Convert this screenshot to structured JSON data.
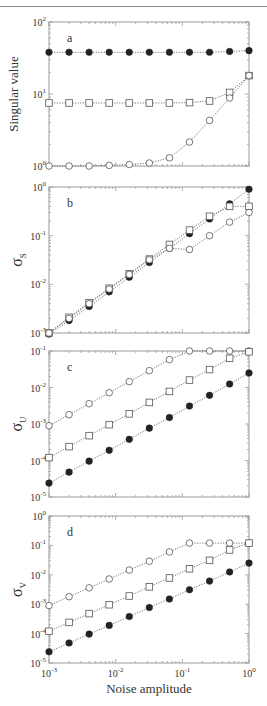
{
  "figure": {
    "x_label": "Noise amplitude",
    "x_scale": "log",
    "x_range": [
      0.001,
      1
    ],
    "x_ticks": [
      {
        "base": "10",
        "exp": "-3",
        "v": 0.001
      },
      {
        "base": "10",
        "exp": "-2",
        "v": 0.01
      },
      {
        "base": "10",
        "exp": "-1",
        "v": 0.1
      },
      {
        "base": "10",
        "exp": "0",
        "v": 1
      }
    ],
    "colors": {
      "frame": "#9a9a9a",
      "line": "#555555",
      "marker": "#222222",
      "text": "#333333"
    }
  },
  "chart_data": [
    {
      "type": "line",
      "panel": "a",
      "title": "",
      "xlabel": "",
      "ylabel": "Singular value",
      "ylabel_sub": "",
      "xscale": "log",
      "yscale": "log",
      "xlim": [
        0.001,
        1
      ],
      "ylim": [
        1,
        100
      ],
      "y_ticks": [
        {
          "base": "10",
          "exp": "0",
          "v": 1
        },
        {
          "base": "10",
          "exp": "1",
          "v": 10
        },
        {
          "base": "10",
          "exp": "2",
          "v": 100
        }
      ],
      "x": [
        0.001,
        0.002,
        0.004,
        0.008,
        0.016,
        0.032,
        0.064,
        0.128,
        0.256,
        0.512,
        1.0
      ],
      "series": [
        {
          "name": "filled circles",
          "marker": "filled-circle",
          "values": [
            38,
            38,
            38,
            38,
            38,
            38,
            38,
            38,
            38,
            39,
            40
          ]
        },
        {
          "name": "open squares",
          "marker": "open-square",
          "values": [
            7.5,
            7.5,
            7.5,
            7.5,
            7.5,
            7.5,
            7.5,
            7.6,
            8.0,
            10.5,
            18
          ]
        },
        {
          "name": "open circles",
          "marker": "open-circle",
          "values": [
            1.0,
            1.0,
            1.0,
            1.02,
            1.05,
            1.1,
            1.3,
            2.15,
            4.3,
            8.8,
            18
          ]
        }
      ]
    },
    {
      "type": "line",
      "panel": "b",
      "xlabel": "",
      "ylabel": "σ",
      "ylabel_sub": "S",
      "xscale": "log",
      "yscale": "log",
      "xlim": [
        0.001,
        1
      ],
      "ylim": [
        0.001,
        1
      ],
      "y_ticks": [
        {
          "base": "10",
          "exp": "-3",
          "v": 0.001
        },
        {
          "base": "10",
          "exp": "-2",
          "v": 0.01
        },
        {
          "base": "10",
          "exp": "-1",
          "v": 0.1
        },
        {
          "base": "10",
          "exp": "0",
          "v": 1
        }
      ],
      "x": [
        0.001,
        0.002,
        0.004,
        0.008,
        0.016,
        0.032,
        0.064,
        0.128,
        0.256,
        0.512,
        1.0
      ],
      "series": [
        {
          "name": "filled circles",
          "marker": "filled-circle",
          "values": [
            0.00095,
            0.0018,
            0.0035,
            0.007,
            0.014,
            0.028,
            0.055,
            0.11,
            0.22,
            0.45,
            0.9
          ]
        },
        {
          "name": "open squares",
          "marker": "open-square",
          "values": [
            0.001,
            0.0021,
            0.0042,
            0.0083,
            0.0165,
            0.033,
            0.066,
            0.13,
            0.25,
            0.4,
            0.4
          ]
        },
        {
          "name": "open circles",
          "marker": "open-circle",
          "values": [
            0.001,
            0.002,
            0.004,
            0.008,
            0.016,
            0.032,
            0.055,
            0.052,
            0.1,
            0.19,
            0.3
          ]
        }
      ]
    },
    {
      "type": "line",
      "panel": "c",
      "xlabel": "",
      "ylabel": "σ",
      "ylabel_sub": "U",
      "xscale": "log",
      "yscale": "log",
      "xlim": [
        0.001,
        1
      ],
      "ylim": [
        1e-05,
        0.1
      ],
      "y_ticks": [
        {
          "base": "10",
          "exp": "-5",
          "v": 1e-05
        },
        {
          "base": "10",
          "exp": "-4",
          "v": 0.0001
        },
        {
          "base": "10",
          "exp": "-3",
          "v": 0.001
        },
        {
          "base": "10",
          "exp": "-2",
          "v": 0.01
        },
        {
          "base": "10",
          "exp": "-1",
          "v": 0.1
        }
      ],
      "x": [
        0.001,
        0.002,
        0.004,
        0.008,
        0.016,
        0.032,
        0.064,
        0.128,
        0.256,
        0.512,
        1.0
      ],
      "series": [
        {
          "name": "open circles",
          "marker": "open-circle",
          "values": [
            0.0009,
            0.0018,
            0.0036,
            0.0072,
            0.0145,
            0.029,
            0.058,
            0.1,
            0.1,
            0.1,
            0.1
          ]
        },
        {
          "name": "open squares",
          "marker": "open-square",
          "values": [
            0.00012,
            0.00024,
            0.00048,
            0.00096,
            0.0019,
            0.0039,
            0.0078,
            0.016,
            0.031,
            0.063,
            0.095
          ]
        },
        {
          "name": "filled circles",
          "marker": "filled-circle",
          "values": [
            2.4e-05,
            4.8e-05,
            9.6e-05,
            0.00019,
            0.00038,
            0.00077,
            0.0015,
            0.0031,
            0.0061,
            0.0125,
            0.025
          ]
        }
      ]
    },
    {
      "type": "line",
      "panel": "d",
      "xlabel": "Noise amplitude",
      "ylabel": "σ",
      "ylabel_sub": "V",
      "xscale": "log",
      "yscale": "log",
      "xlim": [
        0.001,
        1
      ],
      "ylim": [
        1e-05,
        1
      ],
      "y_ticks": [
        {
          "base": "10",
          "exp": "-5",
          "v": 1e-05
        },
        {
          "base": "10",
          "exp": "-4",
          "v": 0.0001
        },
        {
          "base": "10",
          "exp": "-3",
          "v": 0.001
        },
        {
          "base": "10",
          "exp": "-2",
          "v": 0.01
        },
        {
          "base": "10",
          "exp": "-1",
          "v": 0.1
        },
        {
          "base": "10",
          "exp": "0",
          "v": 1
        }
      ],
      "x": [
        0.001,
        0.002,
        0.004,
        0.008,
        0.016,
        0.032,
        0.064,
        0.128,
        0.256,
        0.512,
        1.0
      ],
      "series": [
        {
          "name": "open circles",
          "marker": "open-circle",
          "values": [
            0.0009,
            0.0018,
            0.0036,
            0.0072,
            0.0145,
            0.029,
            0.06,
            0.12,
            0.12,
            0.12,
            0.12
          ]
        },
        {
          "name": "open squares",
          "marker": "open-square",
          "values": [
            0.00012,
            0.00024,
            0.00048,
            0.00096,
            0.0019,
            0.0039,
            0.0078,
            0.016,
            0.031,
            0.07,
            0.12
          ]
        },
        {
          "name": "filled circles",
          "marker": "filled-circle",
          "values": [
            2.4e-05,
            4.8e-05,
            9.6e-05,
            0.00019,
            0.00038,
            0.00077,
            0.0015,
            0.0031,
            0.0061,
            0.0125,
            0.025
          ]
        }
      ]
    }
  ],
  "layout": {
    "plot_left": 49,
    "plot_right": 249,
    "panels": [
      {
        "top": 22,
        "bottom": 166
      },
      {
        "top": 187,
        "bottom": 333
      },
      {
        "top": 351,
        "bottom": 497
      },
      {
        "top": 516,
        "bottom": 663
      }
    ]
  }
}
